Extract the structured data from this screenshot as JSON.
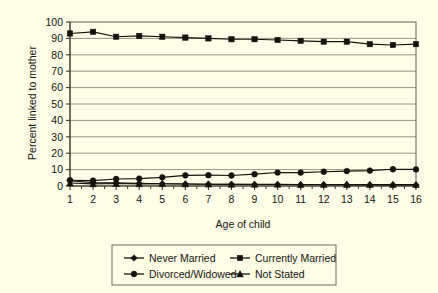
{
  "chart_data": {
    "type": "line",
    "title": "",
    "xlabel": "Age of child",
    "ylabel": "Percent linked to mother",
    "x": [
      1,
      2,
      3,
      4,
      5,
      6,
      7,
      8,
      9,
      10,
      11,
      12,
      13,
      14,
      15,
      16
    ],
    "xtick_labels": [
      "1",
      "2",
      "3",
      "4",
      "5",
      "6",
      "7",
      "8",
      "9",
      "10",
      "11",
      "12",
      "13",
      "14",
      "15",
      "16"
    ],
    "ytick_labels": [
      "0",
      "10",
      "20",
      "30",
      "40",
      "50",
      "60",
      "70",
      "80",
      "90",
      "100"
    ],
    "ylim": [
      0,
      100
    ],
    "ytick_step": 10,
    "grid": "horizontal",
    "legend_position": "bottom",
    "series": [
      {
        "name": "Never Married",
        "marker": "diamond",
        "values": [
          3.2,
          2.1,
          2.0,
          1.6,
          1.4,
          1.2,
          1.1,
          1.0,
          0.9,
          0.9,
          0.8,
          0.8,
          0.7,
          0.7,
          0.7,
          0.6
        ]
      },
      {
        "name": "Currently Married",
        "marker": "square",
        "values": [
          93,
          94,
          91,
          91.5,
          91,
          90.5,
          90,
          89.5,
          89.5,
          89,
          88.5,
          88,
          88,
          86.5,
          86,
          86.5
        ]
      },
      {
        "name": "Divorced/Widowed",
        "marker": "circle",
        "values": [
          3.5,
          3.3,
          4.3,
          4.5,
          5.3,
          6.5,
          6.6,
          6.4,
          7.2,
          8.2,
          8.2,
          8.7,
          9.1,
          9.4,
          10.2,
          10.1
        ]
      },
      {
        "name": "Not Stated",
        "marker": "triangle",
        "values": [
          1.8,
          1.3,
          1.5,
          1.3,
          1.4,
          1.2,
          1.1,
          1.0,
          1.0,
          1.0,
          0.9,
          0.9,
          0.9,
          0.8,
          0.8,
          0.8
        ]
      }
    ]
  },
  "legend": {
    "items": [
      {
        "label": "Never Married",
        "marker": "diamond"
      },
      {
        "label": "Currently Married",
        "marker": "square"
      },
      {
        "label": "Divorced/Widowed",
        "marker": "circle"
      },
      {
        "label": "Not Stated",
        "marker": "triangle"
      }
    ]
  },
  "colors": {
    "background": "#fdfde8",
    "ink": "#14140c",
    "grid": "#8a8a7a",
    "border": "#6e6e5e"
  }
}
